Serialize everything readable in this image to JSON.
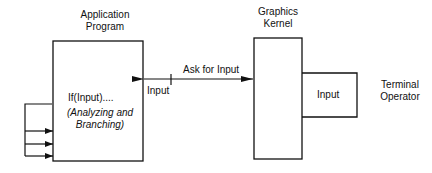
{
  "diagram": {
    "application_program": {
      "title_line1": "Application",
      "title_line2": "Program",
      "code_line": "If(Input)....",
      "comment_line1": "(Analyzing and",
      "comment_line2": "Branching)"
    },
    "graphics_kernel": {
      "title_line1": "Graphics",
      "title_line2": "Kernel"
    },
    "input_device": {
      "label": "Input"
    },
    "terminal_operator": {
      "line1": "Terminal",
      "line2": "Operator"
    },
    "connection": {
      "request_label": "Ask for Input",
      "return_label": "Input"
    },
    "feedback_branches": 3
  }
}
